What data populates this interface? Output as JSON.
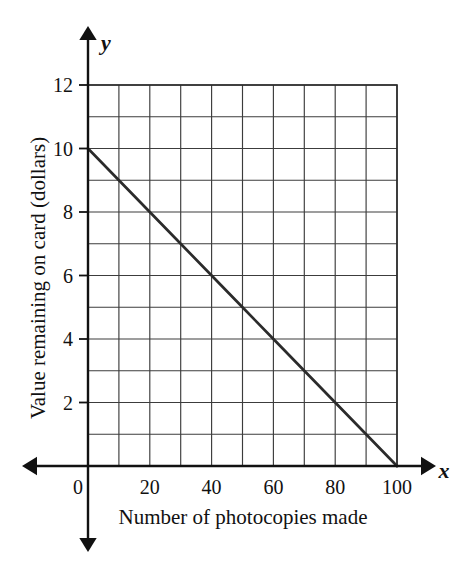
{
  "chart_data": {
    "type": "line",
    "title": "",
    "subtitle": "",
    "xlabel": "Number of photocopies made",
    "ylabel": "Value remaining on card (dollars)",
    "x_axis_letter": "x",
    "y_axis_letter": "y",
    "xlim": [
      0,
      100
    ],
    "ylim": [
      0,
      12
    ],
    "x_tick_labels": [
      "0",
      "20",
      "40",
      "60",
      "80",
      "100"
    ],
    "x_tick_values": [
      0,
      20,
      40,
      60,
      80,
      100
    ],
    "y_tick_labels": [
      "2",
      "4",
      "6",
      "8",
      "10",
      "12"
    ],
    "y_tick_values": [
      2,
      4,
      6,
      8,
      10,
      12
    ],
    "x_gridline_step": 10,
    "y_gridline_step": 1,
    "grid": true,
    "grid_columns": 10,
    "grid_rows": 12,
    "legend": "none",
    "origin_label": "0",
    "axis_arrows": "both-directions",
    "series": [
      {
        "name": "Value remaining on card",
        "points": [
          {
            "x": 0,
            "y": 10
          },
          {
            "x": 10,
            "y": 9
          },
          {
            "x": 20,
            "y": 8
          },
          {
            "x": 30,
            "y": 7
          },
          {
            "x": 40,
            "y": 6
          },
          {
            "x": 50,
            "y": 5
          },
          {
            "x": 60,
            "y": 4
          },
          {
            "x": 70,
            "y": 3
          },
          {
            "x": 80,
            "y": 2
          },
          {
            "x": 90,
            "y": 1
          },
          {
            "x": 100,
            "y": 0
          }
        ],
        "y_intercept": 10,
        "x_intercept": 100,
        "slope": -0.1,
        "equation": "y = 10 - 0.1x",
        "color": "#2b2b2b"
      }
    ]
  },
  "colors": {
    "ink": "#111111",
    "grid": "#3c3c3c",
    "grid_border": "#2a2a2a",
    "data_line": "#2b2b2b",
    "background": "#ffffff"
  }
}
